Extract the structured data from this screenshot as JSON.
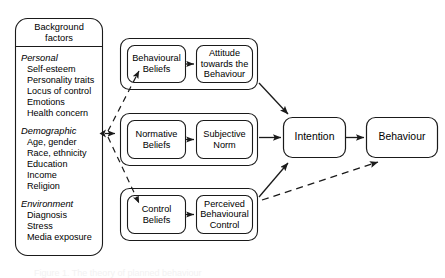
{
  "diagram": {
    "title": "Theory of Planned Behaviour",
    "type": "flow-diagram",
    "stroke_color": "#1a1a1a",
    "background_color": "#ffffff",
    "background_factors": {
      "title_line1": "Background",
      "title_line2": "factors",
      "groups": [
        {
          "heading": "Personal",
          "items": [
            "Self-esteem",
            "Personality traits",
            "Locus of control",
            "Emotions",
            "Health concern"
          ]
        },
        {
          "heading": "Demographic",
          "items": [
            "Age, gender",
            "Race, ethnicity",
            "Education",
            "Income",
            "Religion"
          ]
        },
        {
          "heading": "Environment",
          "items": [
            "Diagnosis",
            "Stress",
            "Media exposure"
          ]
        }
      ]
    },
    "rows": [
      {
        "belief": "Behavioural\nBeliefs",
        "belief_lines": [
          "Behavioural",
          "Beliefs"
        ],
        "construct_lines": [
          "Attitude",
          "towards the",
          "Behaviour"
        ]
      },
      {
        "belief_lines": [
          "Normative",
          "Beliefs"
        ],
        "construct_lines": [
          "Subjective",
          "Norm"
        ]
      },
      {
        "belief_lines": [
          "Control",
          "Beliefs"
        ],
        "construct_lines": [
          "Perceived",
          "Behavioural",
          "Control"
        ]
      }
    ],
    "outcomes": {
      "intention": "Intention",
      "behaviour": "Behaviour"
    },
    "caption_partial": "Figure 1. The theory of planned behaviour"
  }
}
